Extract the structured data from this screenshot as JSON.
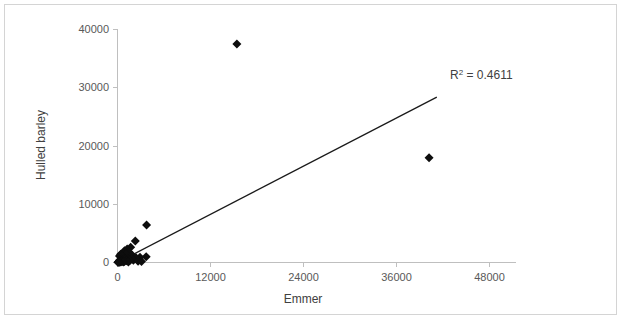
{
  "chart_data": {
    "type": "scatter",
    "title": "",
    "xlabel": "Emmer",
    "ylabel": "Hulled barley",
    "xlim": [
      0,
      48000
    ],
    "ylim": [
      0,
      40000
    ],
    "xticks": [
      0,
      12000,
      24000,
      36000,
      48000
    ],
    "yticks": [
      0,
      10000,
      20000,
      30000,
      40000
    ],
    "xtick_labels": [
      "0",
      "12000",
      "24000",
      "36000",
      "48000"
    ],
    "ytick_labels": [
      "0",
      "10000",
      "20000",
      "30000",
      "40000"
    ],
    "grid": false,
    "legend": false,
    "legend_position": "none",
    "annotations": [
      {
        "name": "r-squared-annotation",
        "text": "R² = 0.4611",
        "base": "R",
        "superscript": "2",
        "rest": " = 0.4611",
        "x": 40000,
        "y": 32500
      }
    ],
    "series": [
      {
        "name": "Hulled barley vs Emmer",
        "marker": "diamond",
        "marker_color": "#0d0d0d",
        "marker_size": 9,
        "points": [
          [
            15400,
            37500
          ],
          [
            40200,
            18000
          ],
          [
            3750,
            6450
          ],
          [
            2300,
            3700
          ],
          [
            1700,
            2600
          ],
          [
            1250,
            2300
          ],
          [
            900,
            2000
          ],
          [
            1500,
            1750
          ],
          [
            700,
            1600
          ],
          [
            1100,
            1450
          ],
          [
            400,
            1400
          ],
          [
            1900,
            1250
          ],
          [
            600,
            1150
          ],
          [
            250,
            1100
          ],
          [
            3700,
            1000
          ],
          [
            2900,
            900
          ],
          [
            2400,
            800
          ],
          [
            1800,
            700
          ],
          [
            1350,
            650
          ],
          [
            1000,
            600
          ],
          [
            800,
            550
          ],
          [
            500,
            500
          ],
          [
            300,
            450
          ],
          [
            2050,
            400
          ],
          [
            1600,
            350
          ],
          [
            1150,
            300
          ],
          [
            650,
            280
          ],
          [
            420,
            250
          ],
          [
            200,
            220
          ],
          [
            2650,
            200
          ],
          [
            3100,
            180
          ],
          [
            900,
            160
          ],
          [
            550,
            140
          ],
          [
            150,
            120
          ],
          [
            350,
            100
          ],
          [
            1400,
            90
          ],
          [
            750,
            70
          ],
          [
            100,
            60
          ],
          [
            250,
            40
          ],
          [
            60,
            25
          ]
        ]
      }
    ],
    "trendline": {
      "name": "linear-trendline",
      "color": "#1a1a1a",
      "x_start": 0,
      "y_start": 0,
      "x_end": 41200,
      "y_end": 28400,
      "r_squared": 0.4611
    }
  }
}
